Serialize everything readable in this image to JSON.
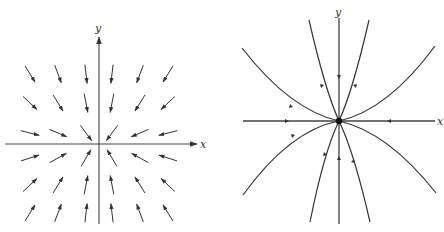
{
  "figure": {
    "panels": [
      {
        "id": "vector-field",
        "description": "Direction field with all arrows pointing toward the origin",
        "axes": {
          "x_label": "x",
          "y_label": "y"
        },
        "origin": [
          99,
          144
        ],
        "arrow_grid": {
          "columns_x": [
            30,
            58,
            86,
            112,
            140,
            168
          ],
          "rows_y": [
            74,
            103,
            133,
            158,
            185,
            213
          ],
          "direction": "toward-origin"
        }
      },
      {
        "id": "phase-portrait",
        "description": "Phase portrait: stable node at origin with parabolic trajectories",
        "axes": {
          "x_label": "x",
          "y_label": "y"
        },
        "origin": [
          339,
          121
        ],
        "equilibrium": "stable-node",
        "trajectories": [
          {
            "name": "wide-upper-left",
            "from": [
              242,
              48
            ]
          },
          {
            "name": "wide-upper-right",
            "from": [
              435,
              46
            ]
          },
          {
            "name": "wide-lower-left",
            "from": [
              243,
              195
            ]
          },
          {
            "name": "wide-lower-right",
            "from": [
              436,
              193
            ]
          },
          {
            "name": "narrow-upper-left",
            "from": [
              309,
              20
            ]
          },
          {
            "name": "narrow-upper-right",
            "from": [
              369,
              20
            ]
          },
          {
            "name": "narrow-lower-left",
            "from": [
              310,
              222
            ]
          },
          {
            "name": "narrow-lower-right",
            "from": [
              370,
              222
            ]
          }
        ]
      }
    ],
    "colors": {
      "ink": "#333333",
      "background": "#ffffff"
    }
  }
}
